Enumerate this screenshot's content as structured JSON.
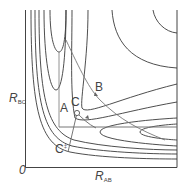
{
  "diagram": {
    "type": "potential_energy_surface_contour",
    "axes": {
      "x_label_main": "R",
      "x_label_sub": "AB",
      "y_label_main": "R",
      "y_label_sub": "BC",
      "origin": "0"
    },
    "points": {
      "A": "A",
      "B": "B",
      "C": "C",
      "C_dagger_main": "C",
      "C_dagger_sup": "‡"
    },
    "colors": {
      "contour": "#3a3a3a",
      "path": "#555555",
      "axis": "#444444"
    }
  }
}
